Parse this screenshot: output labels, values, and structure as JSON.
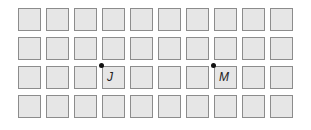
{
  "grid": {
    "rows": 4,
    "cols": 10,
    "origin_x": 18,
    "origin_y": 8,
    "step_x": 28,
    "step_y": 29,
    "fill": "#e6e6e6",
    "stroke": "#8c8c8c"
  },
  "points": [
    {
      "label": "J",
      "row": 2,
      "col": 3
    },
    {
      "label": "M",
      "row": 2,
      "col": 7
    }
  ]
}
